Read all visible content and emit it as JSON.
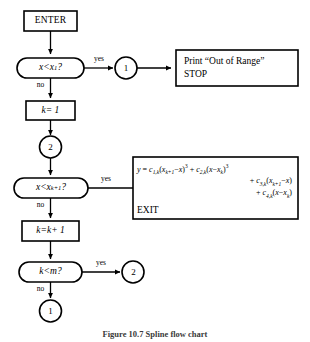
{
  "figure": {
    "caption": "Figure 10.7  Spline flow chart"
  },
  "nodes": {
    "enter": {
      "label": "ENTER"
    },
    "decision_x_lt_x1": {
      "label_html": "<span class=\"mvar\">x</span> &lt; <span class=\"mvar\">x</span><sub>1</sub>?"
    },
    "connector_1_top": {
      "label": "1"
    },
    "print_stop": {
      "line1": "Print “Out of Range”",
      "line2": "STOP"
    },
    "process_k_eq_1": {
      "label_html": "<span class=\"mvar\">k</span> = 1"
    },
    "connector_2_mid": {
      "label": "2"
    },
    "decision_x_lt_xk1": {
      "label_html": "<span class=\"mvar\">x</span> &lt; <span class=\"mvar\">x</span><sub>k+1</sub>?"
    },
    "formula_exit": {
      "line1_html": "<span class=\"mvar\">y</span> = <span class=\"mvar\">c</span><sub>1,k</sub>(<span class=\"mvar\">x</span><sub>k+1</sub>&minus;<span class=\"mvar\">x</span>)<sup>3</sup> + <span class=\"mvar\">c</span><sub>2,k</sub>(<span class=\"mvar\">x</span>&minus;<span class=\"mvar\">x</span><sub>k</sub>)<sup>3</sup>",
      "line2_html": "+ <span class=\"mvar\">c</span><sub>3,k</sub>(<span class=\"mvar\">x</span><sub>k+1</sub>&minus;<span class=\"mvar\">x</span>)",
      "line3_html": "+ <span class=\"mvar\">c</span><sub>4,k</sub>(<span class=\"mvar\">x</span>&minus;<span class=\"mvar\">x</span><sub>k</sub>)",
      "exit_label": "EXIT"
    },
    "process_k_eq_k_plus_1": {
      "label_html": "<span class=\"mvar\">k</span> = <span class=\"mvar\">k</span> + 1"
    },
    "decision_k_lt_m": {
      "label_html": "<span class=\"mvar\">k</span> &lt; <span class=\"mvar\">m</span>?"
    },
    "connector_2_right": {
      "label": "2"
    },
    "connector_1_bottom": {
      "label": "1"
    }
  },
  "edges": {
    "yes_1": {
      "label": "yes"
    },
    "no_1": {
      "label": "no"
    },
    "yes_2": {
      "label": "yes"
    },
    "no_2": {
      "label": "no"
    },
    "yes_3": {
      "label": "yes"
    },
    "no_3": {
      "label": "no"
    }
  },
  "style": {
    "stroke": "#000000",
    "background": "#ffffff"
  }
}
